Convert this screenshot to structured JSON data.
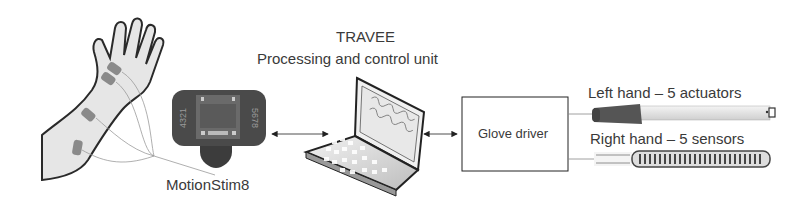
{
  "diagram": {
    "processing_unit": {
      "title": "TRAVEE",
      "subtitle": "Processing and control unit",
      "icon": "laptop-icon"
    },
    "stimulator": {
      "label": "MotionStim8",
      "icon": "stimulator-device-icon",
      "left_digits": "4321",
      "right_digits": "5678"
    },
    "glove_driver": {
      "label": "Glove driver"
    },
    "left_hand": {
      "label": "Left hand – 5 actuators",
      "icon": "linear-actuator-icon"
    },
    "right_hand": {
      "label": "Right hand – 5 sensors",
      "icon": "flex-sensor-icon"
    },
    "arm": {
      "icon": "arm-with-electrodes-icon",
      "electrodes": 4
    },
    "connections": [
      {
        "from": "stimulator",
        "to": "processing_unit",
        "type": "bidirectional-arrow"
      },
      {
        "from": "processing_unit",
        "to": "glove_driver",
        "type": "bidirectional-arrow"
      },
      {
        "from": "glove_driver",
        "to": "left_hand",
        "type": "line"
      },
      {
        "from": "glove_driver",
        "to": "right_hand",
        "type": "line"
      },
      {
        "from": "arm",
        "to": "stimulator",
        "type": "wires"
      }
    ],
    "colors": {
      "arm_fill": "#e6e6e6",
      "arm_stroke": "#2a2a2a",
      "electrode": "#8a8a8a",
      "device_body": "#4a4a4a",
      "arrow": "#222222",
      "box_stroke": "#222222"
    }
  }
}
